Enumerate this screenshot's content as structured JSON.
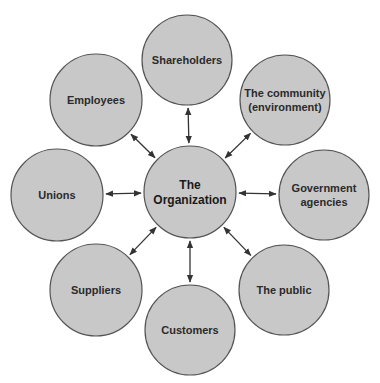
{
  "diagram": {
    "type": "hub-and-spoke",
    "center": {
      "id": "org",
      "lines": [
        "The",
        "Organization"
      ],
      "cx": 190,
      "cy": 192,
      "r": 46
    },
    "nodes": [
      {
        "id": "shareholders",
        "lines": [
          "Shareholders"
        ],
        "cx": 187,
        "cy": 60,
        "r": 45
      },
      {
        "id": "community",
        "lines": [
          "The community",
          "(environment)"
        ],
        "cx": 285,
        "cy": 100,
        "r": 45
      },
      {
        "id": "government",
        "lines": [
          "Government",
          "agencies"
        ],
        "cx": 324,
        "cy": 195,
        "r": 45
      },
      {
        "id": "public",
        "lines": [
          "The public"
        ],
        "cx": 284,
        "cy": 290,
        "r": 45
      },
      {
        "id": "customers",
        "lines": [
          "Customers"
        ],
        "cx": 190,
        "cy": 330,
        "r": 45
      },
      {
        "id": "suppliers",
        "lines": [
          "Suppliers"
        ],
        "cx": 96,
        "cy": 290,
        "r": 46
      },
      {
        "id": "unions",
        "lines": [
          "Unions"
        ],
        "cx": 57,
        "cy": 195,
        "r": 46
      },
      {
        "id": "employees",
        "lines": [
          "Employees"
        ],
        "cx": 96,
        "cy": 100,
        "r": 46
      }
    ],
    "edges": "bidirectional arrows from center to each node"
  },
  "colors": {
    "circle_fill": "#c8c8c8",
    "circle_stroke": "#555555",
    "text": "#2b2b2b",
    "arrow": "#333333"
  }
}
